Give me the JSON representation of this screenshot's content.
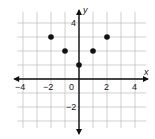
{
  "chart_data": {
    "type": "scatter",
    "title": "",
    "xlabel": "x",
    "ylabel": "y",
    "xlim": [
      -4.5,
      4.5
    ],
    "ylim": [
      -3.5,
      4.5
    ],
    "grid": true,
    "x_tick_labels": [
      "-4",
      "-2",
      "0",
      "2",
      "4"
    ],
    "y_tick_labels": [
      "4",
      "-2"
    ],
    "points": [
      {
        "x": -2,
        "y": 3
      },
      {
        "x": -1,
        "y": 2
      },
      {
        "x": 0,
        "y": 1
      },
      {
        "x": 1,
        "y": 2
      },
      {
        "x": 2,
        "y": 3
      }
    ]
  },
  "axes": {
    "x_label": "x",
    "y_label": "y",
    "origin_label": "0",
    "x_ticks": [
      {
        "value": -4,
        "label": "−4"
      },
      {
        "value": -2,
        "label": "−2"
      },
      {
        "value": 2,
        "label": "2"
      },
      {
        "value": 4,
        "label": "4"
      }
    ],
    "y_ticks": [
      {
        "value": 4,
        "label": "4"
      },
      {
        "value": -2,
        "label": "−2"
      }
    ]
  }
}
